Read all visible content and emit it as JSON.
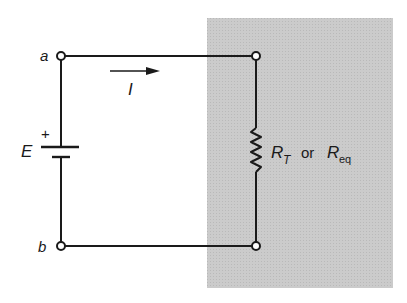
{
  "diagram": {
    "type": "circuit-schematic",
    "colors": {
      "wire": "#1a1a1a",
      "shaded_region": "#c8c8c8",
      "background": "#ffffff"
    },
    "nodes": {
      "a": "a",
      "b": "b"
    },
    "source": {
      "label": "E",
      "polarity_plus": "+"
    },
    "current": {
      "label": "I",
      "direction": "right"
    },
    "resistor": {
      "label_main": "R",
      "label_sub_1": "T",
      "label_connector": "or",
      "label_sub_2": "eq"
    }
  }
}
